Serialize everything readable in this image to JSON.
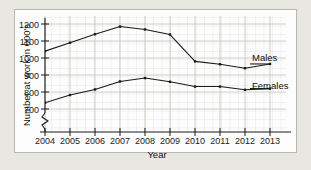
{
  "chart_data": {
    "type": "line",
    "title": "",
    "xlabel": "Year",
    "ylabel": "Number at work in 000's",
    "categories": [
      2004,
      2005,
      2006,
      2007,
      2008,
      2009,
      2010,
      2011,
      2012,
      2013
    ],
    "x_tick_labels": [
      "2004",
      "2005",
      "2006",
      "2007",
      "2008",
      "2009",
      "2010",
      "2011",
      "2012",
      "2013"
    ],
    "y_tick_labels": [
      "700",
      "800",
      "900",
      "1000",
      "1100",
      "1200"
    ],
    "y_ticks": [
      700,
      800,
      900,
      1000,
      1100,
      1200
    ],
    "ylim": [
      700,
      1200
    ],
    "y_axis_break": true,
    "grid": true,
    "legend_position": "right-inline",
    "series": [
      {
        "name": "Males",
        "label": "Males",
        "color": "#1a1a1a",
        "values": [
          1040,
          1090,
          1140,
          1185,
          1168,
          1138,
          980,
          963,
          940,
          965
        ]
      },
      {
        "name": "Females",
        "label": "Females",
        "color": "#1a1a1a",
        "values": [
          737,
          782,
          815,
          862,
          882,
          860,
          832,
          832,
          813,
          820
        ]
      }
    ]
  },
  "colors": {
    "page_background": "#e9e7e2",
    "panel_background": "#fdfdfd",
    "panel_border": "#b9b7b2",
    "axis": "#1b1b1b",
    "grid_minor": "#dedbd6",
    "grid_major": "#c4c1bb",
    "series_line": "#1a1a1a",
    "text": "#111111"
  }
}
